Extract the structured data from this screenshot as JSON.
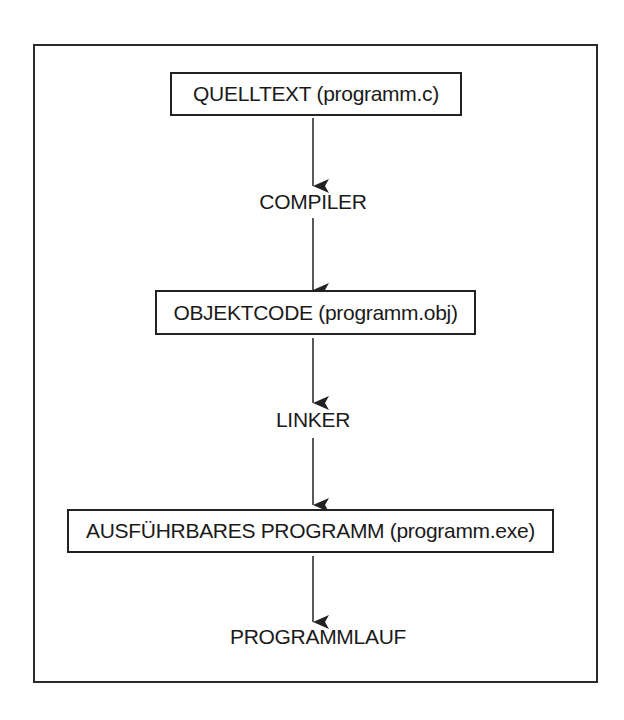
{
  "diagram": {
    "nodes": [
      {
        "id": "quelltext",
        "type": "box",
        "label": "QUELLTEXT (programm.c)"
      },
      {
        "id": "compiler",
        "type": "label",
        "label": "COMPILER"
      },
      {
        "id": "objektcode",
        "type": "box",
        "label": "OBJEKTCODE (programm.obj)"
      },
      {
        "id": "linker",
        "type": "label",
        "label": "LINKER"
      },
      {
        "id": "programm",
        "type": "box",
        "label": "AUSFÜHRBARES PROGRAMM (programm.exe)"
      },
      {
        "id": "programmlauf",
        "type": "label",
        "label": "PROGRAMMLAUF"
      }
    ],
    "edges": [
      {
        "from": "quelltext",
        "to": "compiler"
      },
      {
        "from": "compiler",
        "to": "objektcode"
      },
      {
        "from": "objektcode",
        "to": "linker"
      },
      {
        "from": "linker",
        "to": "programm"
      },
      {
        "from": "programm",
        "to": "programmlauf"
      }
    ],
    "colors": {
      "line": "#222222",
      "background": "#ffffff"
    }
  }
}
